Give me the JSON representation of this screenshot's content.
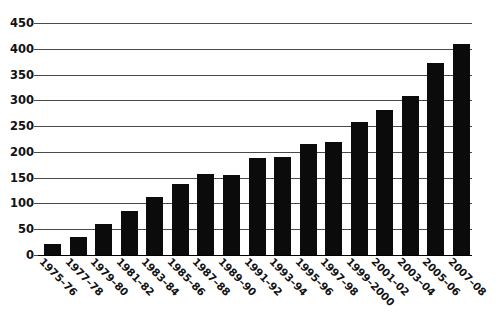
{
  "chart_data": {
    "type": "bar",
    "title": "",
    "subtitle": "",
    "xlabel": "",
    "ylabel": "",
    "ylim": [
      0,
      450
    ],
    "ytick_step": 50,
    "grid": true,
    "legend": "none",
    "bar_color": "#0b0b0b",
    "gridline_color": "#4a4a4a",
    "background_color": "#ffffff",
    "yticks": [
      "0",
      "50",
      "100",
      "150",
      "200",
      "250",
      "300",
      "350",
      "400",
      "450"
    ],
    "categories": [
      "1975–76",
      "1977–78",
      "1979–80",
      "1981–82",
      "1983–84",
      "1985–86",
      "1987–88",
      "1989–90",
      "1991–92",
      "1993–94",
      "1995–96",
      "1997–98",
      "1999–2000",
      "2001–02",
      "2003–04",
      "2005–06",
      "2007–08"
    ],
    "values": [
      22,
      34,
      60,
      86,
      112,
      138,
      157,
      156,
      189,
      190,
      216,
      220,
      258,
      281,
      308,
      372,
      410
    ]
  }
}
